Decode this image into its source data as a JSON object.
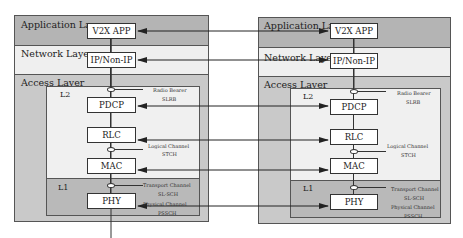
{
  "stacks": [
    {
      "layers": {
        "application": "Application Layer",
        "network": "Network Layer",
        "access": "Access Layer",
        "l2": "L2",
        "l1": "L1"
      },
      "boxes": {
        "v2x_app": "V2X APP",
        "ip": "IP/Non-IP",
        "pdcp": "PDCP",
        "rlc": "RLC",
        "mac": "MAC",
        "phy": "PHY"
      },
      "notes": {
        "radio_bearer": "Radio Bearer",
        "slrb": "SLRB",
        "logical_channel": "Logical Channel",
        "stch": "STCH",
        "transport_channel": "Transport Channel",
        "slsch": "SL-SCH",
        "physical_channel": "Physical Channel",
        "pssch": "PSSCH"
      }
    },
    {
      "layers": {
        "application": "Application Layer",
        "network": "Network Layer",
        "access": "Access Layer",
        "l2": "L2",
        "l1": "L1"
      },
      "boxes": {
        "v2x_app": "V2X APP",
        "ip": "IP/Non-IP",
        "pdcp": "PDCP",
        "rlc": "RLC",
        "mac": "MAC",
        "phy": "PHY"
      },
      "notes": {
        "radio_bearer": "Radio Bearer",
        "slrb": "SLRB",
        "logical_channel": "Logical Channel",
        "stch": "STCH",
        "transport_channel": "Transport Channel",
        "slsch": "SL-SCH",
        "physical_channel": "Physical Channel",
        "pssch": "PSSCH"
      }
    }
  ],
  "colors": {
    "application_band": "#b4b4b4",
    "network_band": "#efefef",
    "access_band": "#c9c9c9",
    "l2_band": "#f0f0f0",
    "l1_band": "#b9b9b9",
    "line": "#222222"
  }
}
